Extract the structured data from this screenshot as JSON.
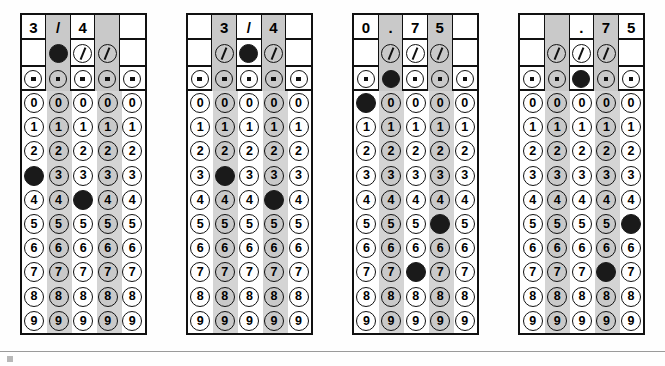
{
  "page": {
    "background_color": "#ffffff",
    "ink_color": "#111111",
    "shade_color": "#c9c9c9",
    "filled_color": "#1a1a1a"
  },
  "legend": {
    "fraction_symbol": "/",
    "decimal_symbol": ".",
    "digits": [
      "0",
      "1",
      "2",
      "3",
      "4",
      "5",
      "6",
      "7",
      "8",
      "9"
    ]
  },
  "grids": [
    {
      "id": "grid-1",
      "answer": "3/4",
      "header": [
        "3",
        "/",
        "4",
        "",
        ""
      ],
      "header_shaded": [
        false,
        true,
        false,
        true,
        false
      ],
      "fraction_row": [
        "",
        "filled",
        "slash",
        "slash",
        ""
      ],
      "decimal_row": [
        "dot",
        "dot",
        "dot",
        "dot",
        "dot"
      ],
      "decimal_filled": [
        false,
        false,
        false,
        false,
        false
      ],
      "columns": [
        {
          "index": 1,
          "shaded": false,
          "filled_digit": "3"
        },
        {
          "index": 2,
          "shaded": true,
          "filled_digit": null
        },
        {
          "index": 3,
          "shaded": false,
          "filled_digit": "4"
        },
        {
          "index": 4,
          "shaded": true,
          "filled_digit": null
        },
        {
          "index": 5,
          "shaded": false,
          "filled_digit": null
        }
      ]
    },
    {
      "id": "grid-2",
      "answer": "3/4",
      "header": [
        "",
        "3",
        "/",
        "4",
        ""
      ],
      "header_shaded": [
        false,
        true,
        false,
        true,
        false
      ],
      "fraction_row": [
        "",
        "slash",
        "filled",
        "slash",
        ""
      ],
      "decimal_row": [
        "dot",
        "dot",
        "dot",
        "dot",
        "dot"
      ],
      "decimal_filled": [
        false,
        false,
        false,
        false,
        false
      ],
      "columns": [
        {
          "index": 1,
          "shaded": false,
          "filled_digit": null
        },
        {
          "index": 2,
          "shaded": true,
          "filled_digit": "3"
        },
        {
          "index": 3,
          "shaded": false,
          "filled_digit": null
        },
        {
          "index": 4,
          "shaded": true,
          "filled_digit": "4"
        },
        {
          "index": 5,
          "shaded": false,
          "filled_digit": null
        }
      ]
    },
    {
      "id": "grid-3",
      "answer": "0.75",
      "header": [
        "0",
        ".",
        "7",
        "5",
        ""
      ],
      "header_shaded": [
        false,
        true,
        false,
        true,
        false
      ],
      "fraction_row": [
        "",
        "slash",
        "slash",
        "slash",
        ""
      ],
      "decimal_row": [
        "dot",
        "filled",
        "dot",
        "dot",
        "dot"
      ],
      "decimal_filled": [
        false,
        true,
        false,
        false,
        false
      ],
      "columns": [
        {
          "index": 1,
          "shaded": false,
          "filled_digit": "0"
        },
        {
          "index": 2,
          "shaded": true,
          "filled_digit": null
        },
        {
          "index": 3,
          "shaded": false,
          "filled_digit": "7"
        },
        {
          "index": 4,
          "shaded": true,
          "filled_digit": "5"
        },
        {
          "index": 5,
          "shaded": false,
          "filled_digit": null
        }
      ]
    },
    {
      "id": "grid-4",
      "answer": ".75",
      "header": [
        "",
        "",
        ".",
        "7",
        "5"
      ],
      "header_shaded": [
        false,
        true,
        false,
        true,
        false
      ],
      "fraction_row": [
        "",
        "slash",
        "slash",
        "slash",
        ""
      ],
      "decimal_row": [
        "dot",
        "dot",
        "filled",
        "dot",
        "dot"
      ],
      "decimal_filled": [
        false,
        false,
        true,
        false,
        false
      ],
      "columns": [
        {
          "index": 1,
          "shaded": false,
          "filled_digit": null
        },
        {
          "index": 2,
          "shaded": true,
          "filled_digit": null
        },
        {
          "index": 3,
          "shaded": false,
          "filled_digit": null
        },
        {
          "index": 4,
          "shaded": true,
          "filled_digit": "7"
        },
        {
          "index": 5,
          "shaded": false,
          "filled_digit": "5"
        }
      ]
    }
  ]
}
